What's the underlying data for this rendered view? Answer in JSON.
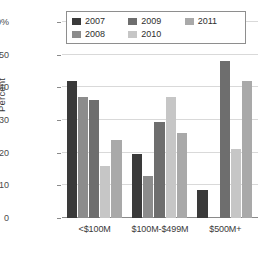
{
  "chart_data": {
    "type": "bar",
    "title": "",
    "xlabel": "",
    "ylabel": "Percent",
    "categories": [
      "<$100M",
      "$100M-$499M",
      "$500M+"
    ],
    "ylim": [
      0,
      60
    ],
    "yticks": [
      "0",
      "10",
      "20",
      "30",
      "40",
      "50",
      "60%"
    ],
    "ytick_values": [
      0,
      10,
      20,
      30,
      40,
      50,
      60
    ],
    "grid": true,
    "legend_position": "top-center",
    "series": [
      {
        "name": "2007",
        "color": "#3a3a3a",
        "values": [
          42,
          19.5,
          8.5
        ]
      },
      {
        "name": "2008",
        "color": "#8c8c8c",
        "values": [
          37,
          13,
          null
        ]
      },
      {
        "name": "2009",
        "color": "#6e6e6e",
        "values": [
          36,
          29.5,
          48
        ]
      },
      {
        "name": "2010",
        "color": "#c6c6c6",
        "values": [
          16,
          37,
          21
        ]
      },
      {
        "name": "2011",
        "color": "#a9a9a9",
        "values": [
          24,
          26,
          42
        ]
      }
    ]
  },
  "legend": {
    "rows": [
      [
        {
          "label": "2007",
          "color": "#3a3a3a"
        },
        {
          "label": "2009",
          "color": "#6e6e6e"
        },
        {
          "label": "2011",
          "color": "#a9a9a9"
        }
      ],
      [
        {
          "label": "2008",
          "color": "#8c8c8c"
        },
        {
          "label": "2010",
          "color": "#c6c6c6"
        },
        {
          "label": "",
          "color": ""
        }
      ]
    ]
  },
  "colors": {
    "grid": "#d9d9d9",
    "axis": "#8a8a8a",
    "text": "#3a3a3a",
    "background": "#ffffff"
  }
}
